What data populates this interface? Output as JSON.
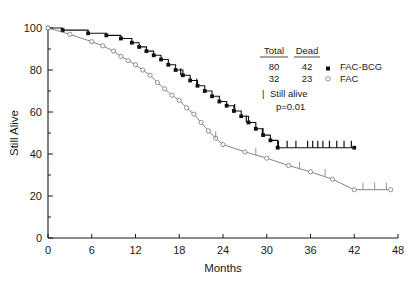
{
  "chart_data": {
    "type": "line",
    "title": "",
    "xlabel": "Months",
    "ylabel": "Still Alive",
    "xlim": [
      0,
      48
    ],
    "ylim": [
      0,
      100
    ],
    "xticks": [
      "0",
      "6",
      "12",
      "18",
      "24",
      "30",
      "36",
      "42",
      "48"
    ],
    "yticks": [
      "0",
      "20",
      "40",
      "60",
      "80",
      "100"
    ],
    "xtick_values": [
      0,
      6,
      12,
      18,
      24,
      30,
      36,
      42,
      48
    ],
    "ytick_values": [
      0,
      20,
      40,
      60,
      80,
      100
    ],
    "grid": false,
    "legend_position": "upper-right",
    "series": [
      {
        "name": "FAC-BCG",
        "marker": "filled-square",
        "total": 80,
        "dead": 42,
        "x": [
          0,
          2,
          5.5,
          8,
          10,
          11.5,
          12.5,
          13.5,
          14.5,
          15.5,
          16.5,
          17.5,
          18.5,
          19.5,
          20.5,
          21.5,
          22.5,
          23.5,
          24.5,
          25.5,
          26.5,
          27.5,
          28.5,
          29.5,
          30.5,
          31.5,
          42
        ],
        "y": [
          100,
          99,
          97.5,
          96.5,
          95,
          93,
          91,
          89,
          87,
          85,
          82.5,
          80,
          77.5,
          75,
          72.5,
          70,
          67.5,
          65,
          63,
          60.5,
          58,
          55,
          52,
          49,
          46.5,
          43,
          43
        ],
        "censor_x": [
          18.2,
          20.4,
          25.6,
          27.2,
          29.4,
          31.6,
          32.8,
          34.0,
          35.6,
          36.3,
          37.0,
          37.7,
          38.6,
          39.6,
          40.6,
          41.6
        ],
        "censor_y": [
          77.5,
          72.5,
          60.5,
          55,
          49,
          43,
          43,
          43,
          43,
          43,
          43,
          43,
          43,
          43,
          43,
          43
        ]
      },
      {
        "name": "FAC",
        "marker": "open-circle",
        "total": 32,
        "dead": 23,
        "x": [
          0,
          3,
          6,
          7.5,
          9,
          10,
          11,
          12,
          13,
          14,
          15,
          16,
          17,
          18,
          19,
          20,
          21,
          22,
          23,
          24,
          27,
          30,
          33,
          36,
          39,
          42,
          47
        ],
        "y": [
          100,
          97,
          93.5,
          91.5,
          89,
          86.5,
          84.5,
          82.5,
          80,
          77.5,
          74,
          71,
          68,
          65.5,
          62,
          59,
          55,
          51,
          47.5,
          44.5,
          41,
          38,
          34.5,
          31.5,
          28,
          23,
          23
        ],
        "censor_x": [
          23.0,
          28.5,
          34.5,
          38.0,
          43.2,
          44.8,
          46.4
        ],
        "censor_y": [
          47.5,
          39.5,
          33,
          29.5,
          23,
          23,
          23
        ]
      }
    ],
    "legend": {
      "columns": [
        "Total",
        "Dead"
      ],
      "rows": [
        {
          "total": "80",
          "dead": "42",
          "marker": "filled-square",
          "label": "FAC-BCG"
        },
        {
          "total": "32",
          "dead": "23",
          "marker": "open-circle",
          "label": "FAC"
        }
      ],
      "censor_note": "Still alive",
      "censor_symbol": "|",
      "pvalue": "p=0.01"
    },
    "colors": {
      "bcg": "#111111",
      "fac": "#777777",
      "axis": "#1a1a1a",
      "background": "#ffffff"
    }
  }
}
